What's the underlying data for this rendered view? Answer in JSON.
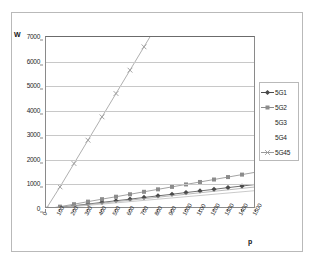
{
  "chart_data": {
    "type": "line",
    "title": "",
    "xlabel": "p",
    "ylabel": "W",
    "xlim": [
      0,
      1500
    ],
    "ylim": [
      0,
      7000
    ],
    "grid": true,
    "legend_position": "right",
    "xticks": [
      "0",
      "100",
      "200",
      "300",
      "400",
      "500",
      "600",
      "700",
      "800",
      "900",
      "1000",
      "1100",
      "1200",
      "1300",
      "1400",
      "1500"
    ],
    "yticks": [
      "0",
      "1000",
      "2000",
      "3000",
      "4000",
      "5000",
      "6000",
      "7000"
    ],
    "x": [
      0,
      100,
      200,
      300,
      400,
      500,
      600,
      700,
      800,
      900,
      1000,
      1100,
      1200,
      1300,
      1400,
      1500
    ],
    "series": [
      {
        "name": "5G1",
        "marker": "diamond",
        "color": "#4a4a4a",
        "values": [
          0,
          70,
          135,
          200,
          270,
          335,
          400,
          470,
          535,
          600,
          670,
          735,
          800,
          870,
          935,
          1000
        ]
      },
      {
        "name": "5G2",
        "marker": "square",
        "color": "#8c8c8c",
        "values": [
          0,
          95,
          195,
          300,
          400,
          500,
          600,
          700,
          800,
          900,
          1000,
          1100,
          1200,
          1300,
          1400,
          1500
        ]
      },
      {
        "name": "5G3",
        "marker": "none",
        "color": "#a8a8a8",
        "values": [
          0,
          60,
          120,
          180,
          240,
          300,
          360,
          420,
          480,
          540,
          600,
          660,
          720,
          780,
          840,
          900
        ]
      },
      {
        "name": "5G4",
        "marker": "none",
        "color": "#bdbdbd",
        "values": [
          0,
          50,
          100,
          150,
          200,
          250,
          300,
          350,
          400,
          450,
          500,
          550,
          600,
          650,
          700,
          750
        ]
      },
      {
        "name": "5G45",
        "marker": "cross",
        "color": "#9a9a9a",
        "values": [
          0,
          900,
          1850,
          2800,
          3750,
          4700,
          5650,
          6600,
          7550,
          8500,
          9450,
          10400,
          11350,
          12300,
          13250,
          14200
        ]
      }
    ]
  },
  "legend": {
    "items": [
      {
        "label": "5G1"
      },
      {
        "label": "5G2"
      },
      {
        "label": "5G3"
      },
      {
        "label": "5G4"
      },
      {
        "label": "5G45"
      }
    ]
  }
}
